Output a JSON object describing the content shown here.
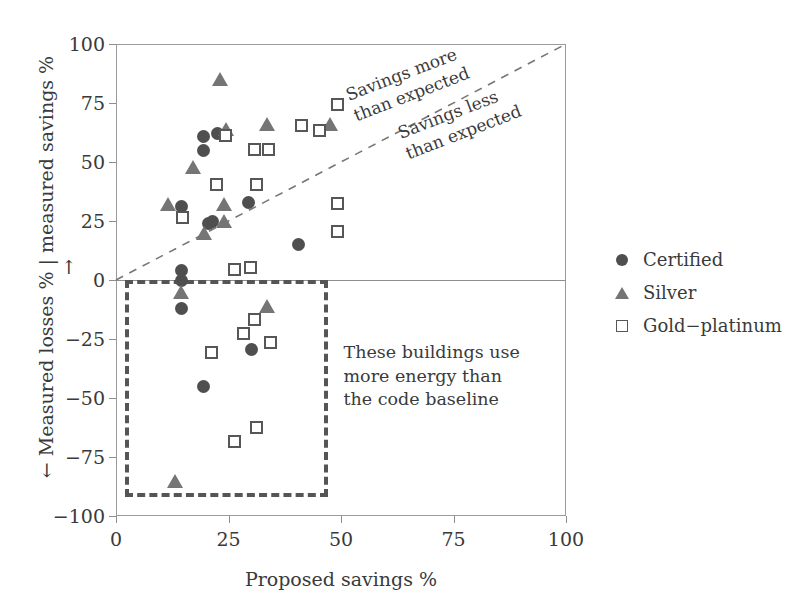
{
  "chart_data": {
    "type": "scatter",
    "title": "",
    "xlabel": "Proposed savings %",
    "ylabel": "← Measured losses % | measured savings % →",
    "xlim": [
      0,
      100
    ],
    "ylim": [
      -100,
      100
    ],
    "xticks": [
      "0",
      "25",
      "50",
      "75",
      "100"
    ],
    "xtick_values": [
      0,
      25,
      50,
      75,
      100
    ],
    "yticks": [
      "100",
      "75",
      "50",
      "25",
      "0",
      "−25",
      "−50",
      "−75",
      "−100"
    ],
    "ytick_values": [
      100,
      75,
      50,
      25,
      0,
      -25,
      -50,
      -75,
      -100
    ],
    "grid": false,
    "legend_position": "right",
    "colors": {
      "certified": "#4f4f4f",
      "silver": "#757575",
      "gold_platinum_edge": "#575757",
      "gold_platinum_fill": "#ffffff",
      "axis": "#9a9a9a",
      "parity_line": "#777777",
      "callout_box": "#555555",
      "text": "#3a3a3a"
    },
    "reference_lines": [
      {
        "name": "parity",
        "style": "dashed",
        "from": [
          0,
          0
        ],
        "to": [
          100,
          100
        ],
        "label_above": "Savings more\nthan expected",
        "label_below": "Savings less\nthan expected"
      }
    ],
    "annotations": [
      {
        "name": "callout-region",
        "text": "These buildings use\nmore energy than\nthe code baseline",
        "box": {
          "x0": 2,
          "x1": 47,
          "y0": -92,
          "y1": 0,
          "style": "dashed"
        }
      }
    ],
    "series": [
      {
        "name": "Certified",
        "marker": "filled-circle",
        "points": [
          [
            14.5,
            31
          ],
          [
            19.5,
            61
          ],
          [
            19.5,
            55
          ],
          [
            22.5,
            62
          ],
          [
            21.5,
            25
          ],
          [
            20.5,
            24
          ],
          [
            29.5,
            33
          ],
          [
            40.5,
            15
          ],
          [
            14.5,
            4
          ],
          [
            14.5,
            0
          ],
          [
            14.5,
            -12
          ],
          [
            30.0,
            -29.5
          ],
          [
            19.5,
            -45
          ]
        ]
      },
      {
        "name": "Silver",
        "marker": "filled-triangle",
        "points": [
          [
            23.0,
            85
          ],
          [
            24.5,
            64
          ],
          [
            33.5,
            66
          ],
          [
            47.5,
            66
          ],
          [
            17.0,
            48
          ],
          [
            11.5,
            32
          ],
          [
            24.0,
            32
          ],
          [
            24.0,
            25
          ],
          [
            19.5,
            20
          ],
          [
            14.5,
            -5
          ],
          [
            33.5,
            -11
          ],
          [
            13.0,
            -85
          ]
        ]
      },
      {
        "name": "Gold−platinum",
        "marker": "open-square",
        "points": [
          [
            49.5,
            74
          ],
          [
            41.5,
            65
          ],
          [
            45.5,
            63
          ],
          [
            24.5,
            61
          ],
          [
            31.0,
            55
          ],
          [
            34.0,
            55
          ],
          [
            22.5,
            40
          ],
          [
            31.5,
            40
          ],
          [
            49.5,
            32
          ],
          [
            15.0,
            26
          ],
          [
            49.5,
            20
          ],
          [
            26.5,
            4
          ],
          [
            30.0,
            5
          ],
          [
            31.0,
            -17
          ],
          [
            28.5,
            -23
          ],
          [
            34.5,
            -27
          ],
          [
            21.5,
            -31
          ],
          [
            31.5,
            -63
          ],
          [
            26.5,
            -69
          ]
        ]
      }
    ]
  },
  "legend": {
    "items": [
      {
        "label": "Certified",
        "marker": "filled-circle"
      },
      {
        "label": "Silver",
        "marker": "filled-triangle"
      },
      {
        "label": "Gold−platinum",
        "marker": "open-square"
      }
    ]
  }
}
